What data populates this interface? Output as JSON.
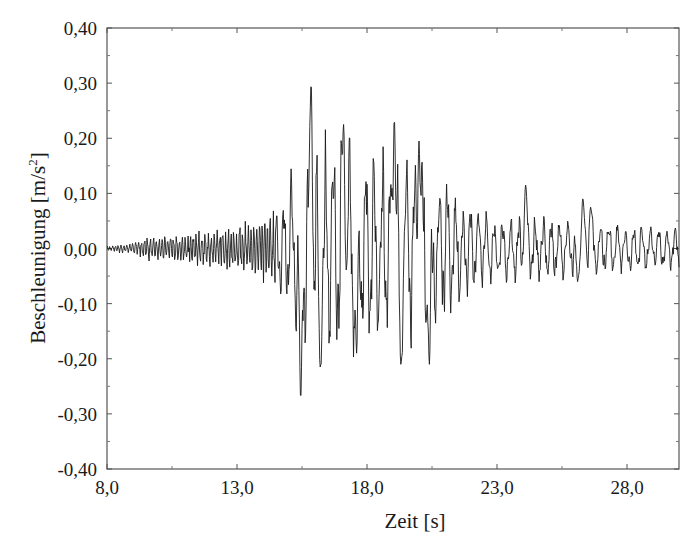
{
  "chart_data": {
    "type": "line",
    "title": "",
    "xlabel": "Zeit [s]",
    "ylabel": "Beschleunigung [m/s²]",
    "ylabel_parts": {
      "main": "Beschleunigung [m/s",
      "sup": "2",
      "end": "]"
    },
    "xlim": [
      8.0,
      30.0
    ],
    "ylim": [
      -0.4,
      0.4
    ],
    "grid": false,
    "legend": null,
    "x_ticks": [
      8.0,
      13.0,
      18.0,
      23.0,
      28.0
    ],
    "x_tick_labels": [
      "8,0",
      "13,0",
      "18,0",
      "23,0",
      "28,0"
    ],
    "x_minor_ticks": [
      10.5,
      15.5,
      20.5,
      25.5
    ],
    "y_ticks": [
      0.4,
      0.3,
      0.2,
      0.1,
      0.0,
      -0.1,
      -0.2,
      -0.3,
      -0.4
    ],
    "y_tick_labels": [
      "0,40",
      "0,30",
      "0,20",
      "0,10",
      "0,00",
      "-0,10",
      "-0,20",
      "-0,30",
      "-0,40"
    ],
    "y_minor_ticks": [
      0.35,
      0.25,
      0.15,
      0.05,
      -0.05,
      -0.15,
      -0.25,
      -0.35
    ],
    "line_color": "#1a1a1a",
    "series": [
      {
        "name": "Beschleunigung",
        "description": "Seismic acceleration time history; low-amplitude noise 8-13.5 s, strong-motion phase 15-21 s, decaying coda to 30 s",
        "key_extrema": [
          {
            "t": 15.45,
            "a": -0.275
          },
          {
            "t": 15.85,
            "a": 0.3
          },
          {
            "t": 16.2,
            "a": -0.215
          },
          {
            "t": 17.1,
            "a": 0.225
          },
          {
            "t": 17.6,
            "a": -0.19
          },
          {
            "t": 19.05,
            "a": 0.235
          },
          {
            "t": 19.3,
            "a": -0.21
          },
          {
            "t": 20.0,
            "a": 0.195
          },
          {
            "t": 20.4,
            "a": -0.21
          },
          {
            "t": 24.1,
            "a": 0.115
          },
          {
            "t": 26.1,
            "a": -0.06
          },
          {
            "t": 26.3,
            "a": 0.09
          },
          {
            "t": 26.6,
            "a": 0.075
          }
        ],
        "envelope": [
          {
            "t": 8.0,
            "amp": 0.005
          },
          {
            "t": 8.8,
            "amp": 0.008
          },
          {
            "t": 9.5,
            "amp": 0.02
          },
          {
            "t": 11.0,
            "amp": 0.025
          },
          {
            "t": 12.5,
            "amp": 0.035
          },
          {
            "t": 13.5,
            "amp": 0.045
          },
          {
            "t": 14.5,
            "amp": 0.07
          },
          {
            "t": 15.2,
            "amp": 0.14
          },
          {
            "t": 16.0,
            "amp": 0.2
          },
          {
            "t": 18.0,
            "amp": 0.17
          },
          {
            "t": 20.5,
            "amp": 0.16
          },
          {
            "t": 21.5,
            "amp": 0.09
          },
          {
            "t": 23.0,
            "amp": 0.055
          },
          {
            "t": 26.0,
            "amp": 0.05
          },
          {
            "t": 28.0,
            "amp": 0.04
          },
          {
            "t": 30.0,
            "amp": 0.035
          }
        ],
        "sample_step": 0.02
      }
    ]
  }
}
